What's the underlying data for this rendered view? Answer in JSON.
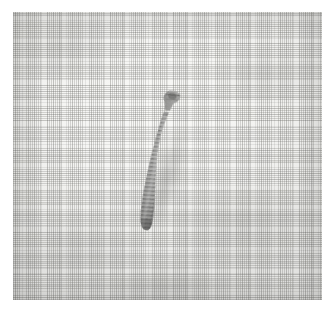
{
  "image": {
    "kind": "photograph",
    "subject": "dental implant screw",
    "caption_visible": "",
    "background_description": "woven cloth / gauze fabric",
    "orientation_degrees": 11.5,
    "colors": {
      "paper_margin": "#ffffff",
      "cloth_light": "#f8f8f6",
      "cloth_mid": "#eeeeec",
      "cloth_shadow": "#e2e2e0",
      "weave_thread": "#969694",
      "implant_head": "#6e6e6c",
      "implant_thread_ridge": "#a6a6a4",
      "implant_thread_groove": "#6a6a68",
      "implant_highlight": "#c4c4c2",
      "implant_apex_shadow": "#565654",
      "cast_shadow": "rgba(96,96,94,0.30)"
    },
    "plate": {
      "left": 13,
      "top": 12,
      "width": 309,
      "height": 288
    }
  },
  "implant": {
    "label": "dental implant screw",
    "parts": [
      {
        "name": "head",
        "description": "flared hexagonal abutment platform"
      },
      {
        "name": "neck",
        "description": "narrow smooth collar below head"
      },
      {
        "name": "threaded-body",
        "description": "tapered helically threaded shank"
      },
      {
        "name": "apex",
        "description": "rounded blunt tip"
      }
    ],
    "thread_count": 31,
    "bounds": {
      "left": 145,
      "top": 90,
      "width": 45,
      "height": 128
    }
  }
}
